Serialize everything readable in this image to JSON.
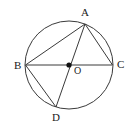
{
  "figure": {
    "type": "circle-geometry-diagram",
    "background_color": "#ffffff",
    "stroke_color": "#3a3a3a",
    "label_color": "#1a1a1a",
    "width": 135,
    "height": 132,
    "circle": {
      "name": "circumscribed-circle",
      "center_x": 69,
      "center_y": 65,
      "radius": 44,
      "stroke_width": 1
    },
    "center_point": {
      "label": "O",
      "x": 69,
      "y": 65,
      "dot_radius": 2.6
    },
    "points": [
      {
        "id": "A",
        "label": "A",
        "x": 85,
        "y": 24,
        "label_x": 81,
        "label_y": 7
      },
      {
        "id": "B",
        "label": "B",
        "x": 25.5,
        "y": 65,
        "label_x": 14,
        "label_y": 60
      },
      {
        "id": "C",
        "label": "C",
        "x": 112.5,
        "y": 65,
        "label_x": 117,
        "label_y": 59
      },
      {
        "id": "D",
        "label": "D",
        "x": 56,
        "y": 107,
        "label_x": 52,
        "label_y": 112
      }
    ],
    "segments": [
      {
        "name": "chord-BC-diameter",
        "from": "B",
        "to": "C",
        "x1": 25.5,
        "y1": 65,
        "x2": 112.5,
        "y2": 65
      },
      {
        "name": "chord-AB",
        "from": "A",
        "to": "B",
        "x1": 85,
        "y1": 24,
        "x2": 25.5,
        "y2": 65
      },
      {
        "name": "chord-AC",
        "from": "A",
        "to": "C",
        "x1": 85,
        "y1": 24,
        "x2": 112.5,
        "y2": 65
      },
      {
        "name": "chord-AD",
        "from": "A",
        "to": "D",
        "x1": 85,
        "y1": 24,
        "x2": 56,
        "y2": 107
      },
      {
        "name": "chord-BD",
        "from": "B",
        "to": "D",
        "x1": 25.5,
        "y1": 65,
        "x2": 56,
        "y2": 107
      }
    ]
  }
}
